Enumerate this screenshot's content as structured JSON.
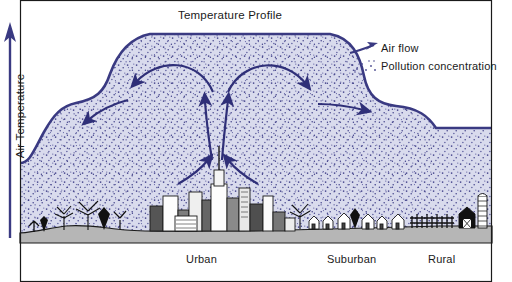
{
  "diagram": {
    "title": "Temperature Profile",
    "axis": {
      "label": "Air Temperature",
      "arrow_icon": "up-arrow-icon",
      "direction": "up"
    },
    "legend": {
      "items": [
        {
          "label": "Air flow",
          "icon": "arrow-icon",
          "color": "#3a3a82"
        },
        {
          "label": "Pollution concentration",
          "icon": "stipple-dots-icon",
          "color": "#4a4a8c"
        }
      ]
    },
    "zones": [
      {
        "label": "Urban",
        "feature_icon": "city-skyline-icon"
      },
      {
        "label": "Suburban",
        "feature_icon": "houses-icon"
      },
      {
        "label": "Rural",
        "feature_icon": "barn-silo-icon"
      }
    ],
    "colors": {
      "dome_fill": "#d9dbed",
      "dome_outline": "#3a3a82",
      "stipple": "#4b4b90",
      "ground": "#b6b6b6",
      "ground_border": "#1a1a1a",
      "arrow": "#2f2f78",
      "text": "#1a1a1a",
      "background": "#ffffff"
    },
    "flow_arrows": [
      {
        "name": "updraft-center-left",
        "direction": "up"
      },
      {
        "name": "updraft-center",
        "direction": "up"
      },
      {
        "name": "inflow-left-low",
        "direction": "up-right"
      },
      {
        "name": "inflow-right-low",
        "direction": "up-left"
      },
      {
        "name": "outflow-upper-left",
        "direction": "down-left"
      },
      {
        "name": "outflow-upper-right",
        "direction": "down-right"
      },
      {
        "name": "outflow-mid-left",
        "direction": "down-left"
      },
      {
        "name": "outflow-mid-right",
        "direction": "right"
      }
    ]
  }
}
